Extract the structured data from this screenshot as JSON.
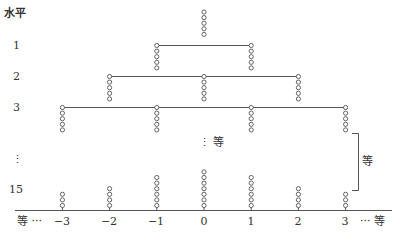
{
  "diagram": {
    "y_axis_label": "水平",
    "levels": [
      {
        "label": "1",
        "y": 46
      },
      {
        "label": "2",
        "y": 77
      },
      {
        "label": "3",
        "y": 108
      },
      {
        "label": "⋮",
        "y": 160
      },
      {
        "label": "15",
        "y": 190
      }
    ],
    "x_axis": {
      "left_label": "等 ···",
      "right_label": "··· 等",
      "ticks": [
        "−3",
        "−2",
        "−1",
        "0",
        "1",
        "2",
        "3"
      ]
    },
    "middle_ellipsis": "⋮ 等",
    "bracket_label": "等",
    "structure": {
      "top_stack": {
        "position": 0,
        "beads": 5
      },
      "level_1": {
        "span": [
          -1,
          1
        ],
        "stacks": [
          {
            "position": -1,
            "beads": 5
          },
          {
            "position": 1,
            "beads": 5
          }
        ]
      },
      "level_2": {
        "span": [
          -2,
          2
        ],
        "stacks": [
          {
            "position": -2,
            "beads": 5
          },
          {
            "position": 0,
            "beads": 5
          },
          {
            "position": 2,
            "beads": 5
          }
        ]
      },
      "level_3": {
        "span": [
          -3,
          3
        ],
        "stacks": [
          {
            "position": -3,
            "beads": 5
          },
          {
            "position": -1,
            "beads": 5
          },
          {
            "position": 1,
            "beads": 5
          },
          {
            "position": 3,
            "beads": 5
          }
        ]
      },
      "level_15_bottom": [
        {
          "position": -3,
          "beads": 3
        },
        {
          "position": -2,
          "beads": 4
        },
        {
          "position": -1,
          "beads": 6
        },
        {
          "position": 0,
          "beads": 7
        },
        {
          "position": 1,
          "beads": 6
        },
        {
          "position": 2,
          "beads": 4
        },
        {
          "position": 3,
          "beads": 3
        }
      ]
    },
    "colors": {
      "line": "#555555",
      "bead": "#555555",
      "text": "#333333"
    }
  }
}
